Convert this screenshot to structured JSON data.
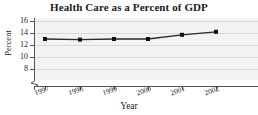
{
  "chart_data": {
    "type": "line",
    "title": "Health Care as a Percent of GDP",
    "xlabel": "Year",
    "ylabel": "Percent",
    "categories": [
      "1997",
      "1998",
      "1999",
      "2000",
      "2001",
      "2002"
    ],
    "x": [
      1997,
      1998,
      1999,
      2000,
      2001,
      2002
    ],
    "values": [
      13.0,
      12.9,
      13.0,
      13.0,
      13.7,
      14.2
    ],
    "series": [
      {
        "name": "Health Care as a Percent of GDP",
        "values": [
          13.0,
          12.9,
          13.0,
          13.0,
          13.7,
          14.2
        ]
      }
    ],
    "ylim": [
      7.0,
      16.8
    ],
    "yticks": [
      8,
      10,
      12,
      14,
      16
    ],
    "ytick_labels": [
      "8",
      "10",
      "12",
      "14",
      "16"
    ],
    "xlim": [
      1996.5,
      2002.6
    ],
    "grid": true,
    "grid_axis": "y",
    "legend": "none",
    "axis_break": {
      "axis": "y",
      "symbol": "zigzag",
      "below_value": 8
    },
    "marker": "square",
    "line_color": "#2a2a2a",
    "marker_color": "#111111",
    "plot_background": "#f3f3f3",
    "gridline_color": "#d8d8d8",
    "axis_color": "#555555"
  },
  "axis_labels": {
    "y": [
      "16",
      "14",
      "12",
      "10",
      "8"
    ],
    "x": [
      "1997",
      "1998",
      "1999",
      "2000",
      "2001",
      "2002"
    ]
  }
}
